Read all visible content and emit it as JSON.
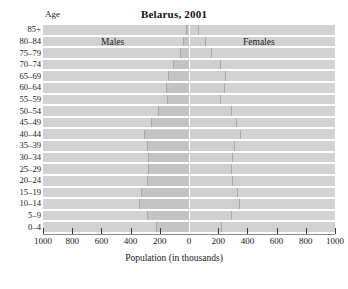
{
  "chart_data": {
    "type": "bar",
    "subtype": "population-pyramid",
    "title": "Belarus, 2001",
    "xlabel": "Population (in thousands)",
    "ylabel": "Age",
    "xlim": [
      -1000,
      1000
    ],
    "xtick_values": [
      -1000,
      -800,
      -600,
      -400,
      -200,
      0,
      200,
      400,
      600,
      800,
      1000
    ],
    "xtick_labels": [
      "1000",
      "800",
      "600",
      "400",
      "200",
      "0",
      "200",
      "400",
      "600",
      "800",
      "1000"
    ],
    "grid": false,
    "legend_position": "inside-top",
    "categories": [
      "85+",
      "80-84",
      "75-79",
      "70-74",
      "65-69",
      "60-64",
      "55-59",
      "50-54",
      "45-49",
      "40-44",
      "35-39",
      "30-34",
      "25-29",
      "20-24",
      "15-19",
      "10-14",
      "5-9",
      "0-4"
    ],
    "series": [
      {
        "name": "Males",
        "side": "left",
        "values": [
          20,
          38,
          62,
          112,
          145,
          155,
          150,
          215,
          260,
          305,
          285,
          280,
          282,
          290,
          330,
          345,
          290,
          225
        ]
      },
      {
        "name": "Females",
        "side": "right",
        "values": [
          60,
          110,
          150,
          215,
          245,
          238,
          212,
          290,
          320,
          350,
          305,
          292,
          288,
          295,
          330,
          342,
          288,
          218
        ]
      }
    ]
  },
  "chart": {
    "title": "Belarus, 2001",
    "age_axis_title": "Age",
    "males_label": "Males",
    "females_label": "Females",
    "x_axis_title": "Population (in thousands)"
  }
}
